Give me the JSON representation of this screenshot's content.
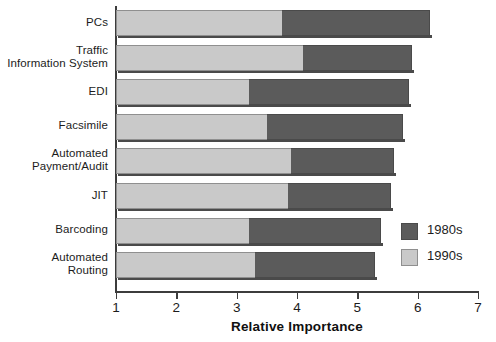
{
  "chart_data": {
    "type": "bar",
    "orientation": "horizontal",
    "stacked": false,
    "title": "",
    "xlabel": "Relative Importance",
    "ylabel": "",
    "xlim": [
      1,
      7
    ],
    "xticks": [
      "1",
      "2",
      "3",
      "4",
      "5",
      "6",
      "7"
    ],
    "grid": false,
    "legend_position": "right-bottom",
    "categories": [
      "PCs",
      "Traffic\nInformation System",
      "EDI",
      "Facsimile",
      "Automated\nPayment/Audit",
      "JIT",
      "Barcoding",
      "Automated\nRouting"
    ],
    "series": [
      {
        "name": "1980s",
        "color": "#5b5b5b",
        "values": [
          6.2,
          5.9,
          5.85,
          5.75,
          5.6,
          5.55,
          5.4,
          5.3
        ]
      },
      {
        "name": "1990s",
        "color": "#c9c9c9",
        "values": [
          3.75,
          4.1,
          3.2,
          3.5,
          3.9,
          3.85,
          3.2,
          3.3
        ]
      }
    ]
  },
  "axis": {
    "x_title": "Relative Importance",
    "ticks": [
      "1",
      "2",
      "3",
      "4",
      "5",
      "6",
      "7"
    ]
  },
  "categories": [
    {
      "lines": [
        "PCs"
      ]
    },
    {
      "lines": [
        "Traffic",
        "Information System"
      ]
    },
    {
      "lines": [
        "EDI"
      ]
    },
    {
      "lines": [
        "Facsimile"
      ]
    },
    {
      "lines": [
        "Automated",
        "Payment/Audit"
      ]
    },
    {
      "lines": [
        "JIT"
      ]
    },
    {
      "lines": [
        "Barcoding"
      ]
    },
    {
      "lines": [
        "Automated",
        "Routing"
      ]
    }
  ],
  "legend": {
    "items": [
      {
        "label": "1980s",
        "color": "#5b5b5b"
      },
      {
        "label": "1990s",
        "color": "#c9c9c9"
      }
    ]
  }
}
